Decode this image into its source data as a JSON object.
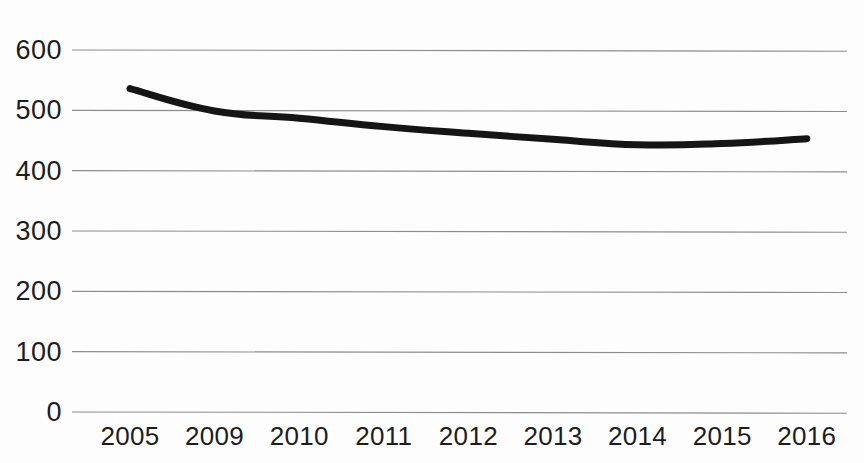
{
  "chart_data": {
    "type": "line",
    "title": "",
    "subtitle": "",
    "xlabel": "",
    "ylabel": "",
    "categories": [
      "2005",
      "2009",
      "2010",
      "2011",
      "2012",
      "2013",
      "2014",
      "2015",
      "2016"
    ],
    "values": [
      536,
      499,
      487,
      473,
      462,
      452,
      443,
      445,
      453
    ],
    "series": [
      {
        "name": "",
        "values": [
          536,
          499,
          487,
          473,
          462,
          452,
          443,
          445,
          453
        ]
      }
    ],
    "ylim": [
      0,
      600
    ],
    "y_ticks": [
      0,
      100,
      200,
      300,
      400,
      500,
      600
    ],
    "y_tick_labels": [
      "0",
      "100",
      "200",
      "300",
      "400",
      "500",
      "600"
    ],
    "x_tick_labels": [
      "2005",
      "2009",
      "2010",
      "2011",
      "2012",
      "2013",
      "2014",
      "2015",
      "2016"
    ],
    "grid": "horizontal",
    "legend": "none",
    "annotations": [],
    "colors": {
      "line": "#151515",
      "gridline": "#8d8d8d",
      "background": "#fdfdfd",
      "tick_text": "#1d1d1d"
    },
    "line_width": 7
  }
}
